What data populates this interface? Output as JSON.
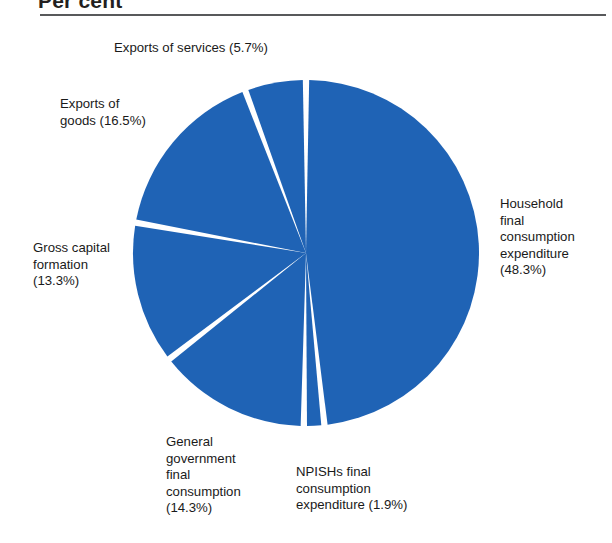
{
  "header": {
    "title": "Per cent"
  },
  "chart_data": {
    "type": "pie",
    "title": "Per cent",
    "xlabel": "",
    "ylabel": "",
    "legend_position": "none",
    "grid": false,
    "units": "percent",
    "slice_color": "#1f63b5",
    "separator_color": "#ffffff",
    "start_angle_deg": 0,
    "direction": "clockwise",
    "categories": [
      "Household final consumption expenditure",
      "NPISHs final consumption expenditure",
      "General government final consumption",
      "Gross capital formation",
      "Exports of goods",
      "Exports of services"
    ],
    "values": [
      48.3,
      1.9,
      14.3,
      13.3,
      16.5,
      5.7
    ],
    "slices": [
      {
        "name": "Household final consumption expenditure",
        "value": 48.3,
        "label": "Household\nfinal\nconsumption\nexpenditure\n(48.3%)",
        "percent_text": "(48.3%)"
      },
      {
        "name": "NPISHs final consumption expenditure",
        "value": 1.9,
        "label": "NPISHs final\nconsumption\nexpenditure (1.9%)",
        "percent_text": "(1.9%)"
      },
      {
        "name": "General government final consumption",
        "value": 14.3,
        "label": "General\ngovernment\nfinal\nconsumption\n(14.3%)",
        "percent_text": "(14.3%)"
      },
      {
        "name": "Gross capital formation",
        "value": 13.3,
        "label": "Gross capital\nformation\n(13.3%)",
        "percent_text": "(13.3%)"
      },
      {
        "name": "Exports of goods",
        "value": 16.5,
        "label": "Exports of\ngoods (16.5%)",
        "percent_text": "(16.5%)"
      },
      {
        "name": "Exports of services",
        "value": 5.7,
        "label": "Exports of services (5.7%)",
        "percent_text": "(5.7%)"
      }
    ]
  },
  "labels": {
    "exports_services": "Exports of services (5.7%)",
    "exports_goods": "Exports of\ngoods (16.5%)",
    "gross_capital": "Gross capital\nformation\n(13.3%)",
    "general_government": "General\ngovernment\nfinal\nconsumption\n(14.3%)",
    "npishs": "NPISHs final\nconsumption\nexpenditure (1.9%)",
    "household": "Household\nfinal\nconsumption\nexpenditure\n(48.3%)"
  }
}
